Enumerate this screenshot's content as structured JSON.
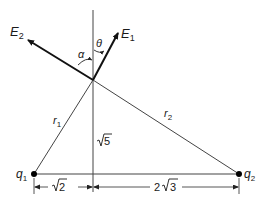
{
  "diagram": {
    "type": "electric field geometry",
    "labels": {
      "E1": "E",
      "E1_sub": "1",
      "E2": "E",
      "E2_sub": "2",
      "alpha": "α",
      "theta": "θ",
      "r1": "r",
      "r1_sub": "1",
      "r2": "r",
      "r2_sub": "2",
      "q1": "q",
      "q1_sub": "1",
      "q2": "q",
      "q2_sub": "2",
      "height": "√5",
      "dist_left": "√2",
      "dist_right": "2√3",
      "dist_right_coef": "2",
      "dist_right_rad": "3",
      "height_rad": "5",
      "dist_left_rad": "2"
    },
    "points": {
      "P": [
        93,
        80
      ],
      "q1": [
        34,
        173
      ],
      "q2": [
        239,
        174
      ],
      "foot": [
        93,
        174
      ],
      "E1_tip": [
        118,
        32
      ],
      "E2_tip": [
        26,
        40
      ]
    },
    "colors": {
      "line": "#333333",
      "vector": "#111111"
    }
  }
}
